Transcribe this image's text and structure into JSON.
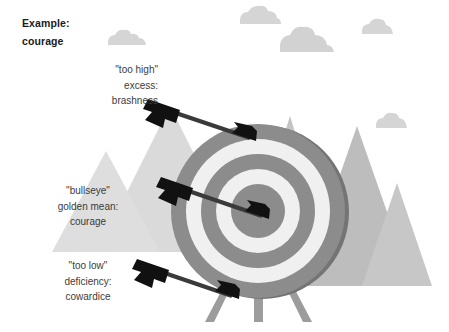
{
  "heading": {
    "line1": "Example:",
    "line2": "courage"
  },
  "callouts": [
    {
      "id": "too-high",
      "line1": "\"too high\"",
      "line2": "excess:",
      "line3": "brashness"
    },
    {
      "id": "bullseye",
      "line1": "\"bullseye\"",
      "line2": "golden mean:",
      "line3": "courage"
    },
    {
      "id": "too-low",
      "line1": "\"too low\"",
      "line2": "deficiency:",
      "line3": "cowardice"
    }
  ],
  "colors": {
    "background": "#ffffff",
    "heading_text": "#1b1b1b",
    "callout_text": "#3c3c3c",
    "mountain_light": "#d8d8d8",
    "mountain_mid": "#c9c9c9",
    "mountain_dark": "#b4b4b4",
    "cloud": "#d2d2d2",
    "target_ring_dark": "#8a8a8a",
    "target_ring_light": "#efefef",
    "target_rim_shadow": "#6f6f6f",
    "target_legs": "#9a9a9a",
    "arrow": "#111111",
    "arrow_shaft": "#3b3b3b"
  },
  "diagram": {
    "type": "archery-target-illustration",
    "target": {
      "center_x": 258,
      "center_y": 211,
      "radii": [
        87,
        72,
        57,
        42,
        27,
        13
      ],
      "ring_count": 6,
      "legs": 3
    },
    "arrows": [
      {
        "name": "arrow-too-high",
        "fletch_x": 150,
        "fletch_y": 103,
        "tip_x": 254,
        "tip_y": 139
      },
      {
        "name": "arrow-bullseye",
        "fletch_x": 163,
        "fletch_y": 180,
        "tip_x": 264,
        "tip_y": 217
      },
      {
        "name": "arrow-too-low",
        "fletch_x": 139,
        "fletch_y": 262,
        "tip_x": 234,
        "tip_y": 297
      }
    ],
    "mountains": [
      {
        "name": "mountain-left-tall",
        "peak_x": 170,
        "peak_y": 108
      },
      {
        "name": "mountain-left-small",
        "peak_x": 106,
        "peak_y": 152
      },
      {
        "name": "mountain-right-tall",
        "peak_x": 357,
        "peak_y": 126
      },
      {
        "name": "mountain-right-small",
        "peak_x": 397,
        "peak_y": 184
      },
      {
        "name": "mountain-center-spike",
        "peak_x": 290,
        "peak_y": 118
      }
    ],
    "clouds": [
      {
        "name": "cloud-left",
        "x": 108,
        "y": 32
      },
      {
        "name": "cloud-top-center",
        "x": 243,
        "y": 8
      },
      {
        "name": "cloud-top-right",
        "x": 367,
        "y": 18
      },
      {
        "name": "cloud-mid-right",
        "x": 376,
        "y": 112
      },
      {
        "name": "cloud-center-large",
        "x": 278,
        "y": 44
      }
    ]
  }
}
